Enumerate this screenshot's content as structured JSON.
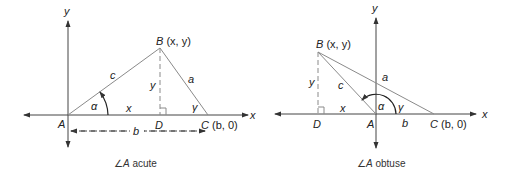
{
  "diagrams": [
    {
      "id": "acute",
      "caption_angle": "∠",
      "caption_var": "A",
      "caption_text": " acute",
      "labels": {
        "x_axis": "x",
        "y_axis": "y",
        "A": "A",
        "B": "B",
        "B_coords": " (x, y)",
        "C": "C",
        "C_coords": " (b, 0)",
        "D": "D",
        "side_a": "a",
        "side_b": "b",
        "side_c": "c",
        "seg_x": "x",
        "seg_y": "y",
        "alpha": "α",
        "gamma": "γ"
      }
    },
    {
      "id": "obtuse",
      "caption_angle": "∠",
      "caption_var": "A",
      "caption_text": " obtuse",
      "labels": {
        "x_axis": "x",
        "y_axis": "y",
        "A": "A",
        "B": "B",
        "B_coords": " (x, y)",
        "C": "C",
        "C_coords": " (b, 0)",
        "D": "D",
        "side_a": "a",
        "side_b": "b",
        "side_c": "c",
        "seg_x": "x",
        "seg_y": "y",
        "alpha": "α",
        "gamma": "γ"
      }
    }
  ],
  "colors": {
    "axis": "#444444",
    "triangle": "#8a8a8a",
    "text": "#222222"
  }
}
